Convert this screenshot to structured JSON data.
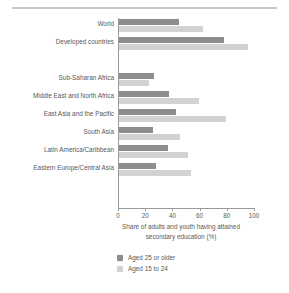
{
  "chart_data": {
    "type": "bar",
    "orientation": "horizontal",
    "title": "",
    "xlabel": "Share of adults and youth having attained secondary education (%)",
    "ylabel": "",
    "xlim": [
      0,
      100
    ],
    "xticks": [
      0,
      20,
      40,
      60,
      80,
      100
    ],
    "xtick_labels": [
      "0",
      "20",
      "40",
      "60",
      "80",
      "100"
    ],
    "grid": false,
    "legend_position": "bottom",
    "categories": [
      "World",
      "Developed countries",
      "",
      "Sub-Saharan Africa",
      "Middle East and North Africa",
      "East Asia and the Pacific",
      "South Asia",
      "Latin America/Caribbean",
      "Eastern Europe/Central Asia"
    ],
    "series": [
      {
        "name": "Aged 25 or older",
        "color": "#8d8d8d",
        "values": [
          44,
          77,
          null,
          26,
          37,
          42,
          25,
          36,
          27
        ]
      },
      {
        "name": "Aged 15 to 24",
        "color": "#d2d2d2",
        "values": [
          62,
          95,
          null,
          22,
          59,
          79,
          45,
          51,
          53
        ]
      }
    ]
  },
  "axis": {
    "label_line1": "Share of adults and youth having attained",
    "label_line2": "secondary education (%)"
  },
  "legend": {
    "items": [
      {
        "label": "Aged 25 or older",
        "color": "#8d8d8d"
      },
      {
        "label": "Aged 15 to 24",
        "color": "#d2d2d2"
      }
    ]
  },
  "colors": {
    "older": "#8d8d8d",
    "youth": "#d2d2d2",
    "axis": "#9a9a9a",
    "text": "#595959",
    "rule": "#c9c9c9",
    "background": "#ffffff"
  }
}
